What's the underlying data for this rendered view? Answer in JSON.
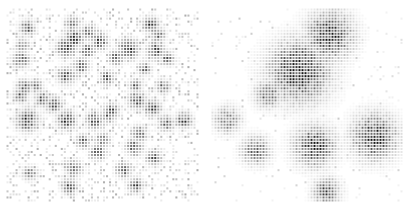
{
  "figure": {
    "width": 409,
    "height": 210,
    "background_color": "#ffffff",
    "panel_count": 2,
    "title": "",
    "dot_color": "#1a1a1a",
    "dot_shape": "square"
  },
  "chart_data": {
    "type": "heatmap",
    "title": "",
    "subtitle": "",
    "xlabel": "",
    "ylabel": "",
    "grid": false,
    "legend": "none",
    "colormap": "greys",
    "value_range": [
      0,
      1
    ],
    "marker": "square",
    "marker_size_px": 2,
    "cell_pitch_px": 3,
    "panels": [
      {
        "name": "left-panel",
        "label": "",
        "origin_px": [
          0,
          0
        ],
        "size_px": [
          205,
          210
        ],
        "plot_inset_px": [
          6,
          8,
          6,
          8
        ],
        "grid_cols": 64,
        "grid_rows": 64,
        "xlim": [
          0,
          64
        ],
        "ylim": [
          0,
          64
        ],
        "description": "dense field of many small dark clusters over light speckle",
        "background_noise_density": 0.34,
        "background_noise_intensity": [
          0.04,
          0.3
        ],
        "cluster_count": 46,
        "cluster_sigma_range": [
          1.1,
          2.6
        ],
        "cluster_peak_range": [
          0.55,
          1.0
        ],
        "random_seed": 20240517,
        "clusters": [
          {
            "cx": 6.5,
            "cy": 6.0,
            "sigma": 1.5,
            "peak": 0.8
          },
          {
            "cx": 21.5,
            "cy": 4.5,
            "sigma": 1.4,
            "peak": 0.74
          },
          {
            "cx": 22.0,
            "cy": 9.5,
            "sigma": 1.9,
            "peak": 0.9
          },
          {
            "cx": 27.0,
            "cy": 7.5,
            "sigma": 1.5,
            "peak": 0.7
          },
          {
            "cx": 30.5,
            "cy": 10.5,
            "sigma": 1.6,
            "peak": 0.78
          },
          {
            "cx": 47.5,
            "cy": 5.0,
            "sigma": 1.5,
            "peak": 0.88
          },
          {
            "cx": 50.0,
            "cy": 8.5,
            "sigma": 1.4,
            "peak": 0.72
          },
          {
            "cx": 5.0,
            "cy": 12.0,
            "sigma": 1.3,
            "peak": 0.62
          },
          {
            "cx": 19.5,
            "cy": 12.5,
            "sigma": 1.8,
            "peak": 0.95
          },
          {
            "cx": 26.5,
            "cy": 13.5,
            "sigma": 1.3,
            "peak": 0.82
          },
          {
            "cx": 40.0,
            "cy": 13.0,
            "sigma": 1.9,
            "peak": 0.92
          },
          {
            "cx": 49.0,
            "cy": 13.5,
            "sigma": 1.7,
            "peak": 0.84
          },
          {
            "cx": 53.0,
            "cy": 16.0,
            "sigma": 1.4,
            "peak": 0.66
          },
          {
            "cx": 4.5,
            "cy": 16.5,
            "sigma": 1.6,
            "peak": 0.76
          },
          {
            "cx": 36.0,
            "cy": 16.0,
            "sigma": 1.4,
            "peak": 0.7
          },
          {
            "cx": 24.5,
            "cy": 18.5,
            "sigma": 1.5,
            "peak": 0.8
          },
          {
            "cx": 45.5,
            "cy": 19.5,
            "sigma": 1.3,
            "peak": 0.64
          },
          {
            "cx": 19.5,
            "cy": 22.0,
            "sigma": 1.7,
            "peak": 0.78
          },
          {
            "cx": 33.0,
            "cy": 22.5,
            "sigma": 1.4,
            "peak": 0.72
          },
          {
            "cx": 5.5,
            "cy": 25.5,
            "sigma": 1.5,
            "peak": 0.7
          },
          {
            "cx": 9.5,
            "cy": 25.0,
            "sigma": 1.3,
            "peak": 0.6
          },
          {
            "cx": 42.5,
            "cy": 25.0,
            "sigma": 1.3,
            "peak": 0.68
          },
          {
            "cx": 51.5,
            "cy": 25.5,
            "sigma": 1.4,
            "peak": 0.66
          },
          {
            "cx": 4.5,
            "cy": 28.5,
            "sigma": 1.4,
            "peak": 0.74
          },
          {
            "cx": 11.5,
            "cy": 29.5,
            "sigma": 1.5,
            "peak": 0.72
          },
          {
            "cx": 15.5,
            "cy": 31.5,
            "sigma": 1.6,
            "peak": 0.8
          },
          {
            "cx": 43.0,
            "cy": 30.0,
            "sigma": 1.7,
            "peak": 0.9
          },
          {
            "cx": 48.0,
            "cy": 32.5,
            "sigma": 1.6,
            "peak": 0.86
          },
          {
            "cx": 34.5,
            "cy": 33.5,
            "sigma": 1.5,
            "peak": 0.76
          },
          {
            "cx": 6.5,
            "cy": 36.5,
            "sigma": 2.1,
            "peak": 0.96
          },
          {
            "cx": 19.5,
            "cy": 36.5,
            "sigma": 1.8,
            "peak": 0.92
          },
          {
            "cx": 29.0,
            "cy": 36.5,
            "sigma": 1.7,
            "peak": 0.82
          },
          {
            "cx": 33.5,
            "cy": 35.0,
            "sigma": 1.4,
            "peak": 0.7
          },
          {
            "cx": 52.5,
            "cy": 37.5,
            "sigma": 1.5,
            "peak": 0.74
          },
          {
            "cx": 58.5,
            "cy": 36.5,
            "sigma": 1.6,
            "peak": 0.78
          },
          {
            "cx": 43.5,
            "cy": 41.0,
            "sigma": 1.5,
            "peak": 0.8
          },
          {
            "cx": 25.0,
            "cy": 43.5,
            "sigma": 1.3,
            "peak": 0.76
          },
          {
            "cx": 31.5,
            "cy": 43.0,
            "sigma": 1.4,
            "peak": 0.68
          },
          {
            "cx": 42.0,
            "cy": 45.5,
            "sigma": 1.6,
            "peak": 0.84
          },
          {
            "cx": 30.0,
            "cy": 47.0,
            "sigma": 1.5,
            "peak": 0.78
          },
          {
            "cx": 48.5,
            "cy": 49.0,
            "sigma": 1.5,
            "peak": 0.8
          },
          {
            "cx": 22.0,
            "cy": 52.5,
            "sigma": 1.6,
            "peak": 0.76
          },
          {
            "cx": 38.5,
            "cy": 53.0,
            "sigma": 1.5,
            "peak": 0.72
          },
          {
            "cx": 7.5,
            "cy": 54.0,
            "sigma": 1.4,
            "peak": 0.64
          },
          {
            "cx": 20.5,
            "cy": 58.5,
            "sigma": 1.5,
            "peak": 0.82
          },
          {
            "cx": 42.5,
            "cy": 58.0,
            "sigma": 1.5,
            "peak": 0.78
          }
        ]
      },
      {
        "name": "right-panel",
        "label": "",
        "origin_px": [
          205,
          0
        ],
        "size_px": [
          204,
          210
        ],
        "plot_inset_px": [
          6,
          8,
          6,
          8
        ],
        "grid_cols": 64,
        "grid_rows": 64,
        "xlim": [
          0,
          64
        ],
        "ylim": [
          0,
          64
        ],
        "description": "sparse field with a few large, well-separated dark clusters",
        "background_noise_density": 0.055,
        "background_noise_intensity": [
          0.03,
          0.18
        ],
        "cluster_count": 7,
        "cluster_sigma_range": [
          3.0,
          6.5
        ],
        "cluster_peak_range": [
          0.7,
          1.0
        ],
        "random_seed": 77310,
        "clusters": [
          {
            "cx": 39.0,
            "cy": 8.5,
            "sigma": 4.6,
            "peak": 0.95
          },
          {
            "cx": 29.0,
            "cy": 20.5,
            "sigma": 6.0,
            "peak": 1.0
          },
          {
            "cx": 18.5,
            "cy": 28.0,
            "sigma": 2.6,
            "peak": 0.72
          },
          {
            "cx": 5.0,
            "cy": 36.5,
            "sigma": 2.6,
            "peak": 0.6
          },
          {
            "cx": 54.0,
            "cy": 42.0,
            "sigma": 4.4,
            "peak": 0.95
          },
          {
            "cx": 34.0,
            "cy": 45.0,
            "sigma": 4.0,
            "peak": 0.88
          },
          {
            "cx": 14.5,
            "cy": 46.5,
            "sigma": 2.8,
            "peak": 0.66
          },
          {
            "cx": 38.0,
            "cy": 60.0,
            "sigma": 2.6,
            "peak": 0.78
          }
        ]
      }
    ]
  }
}
